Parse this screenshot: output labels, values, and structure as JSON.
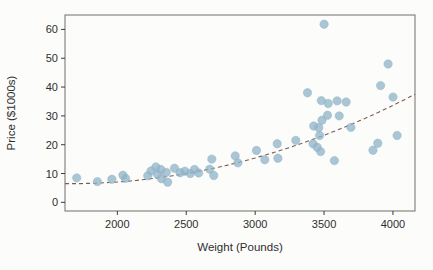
{
  "figure": {
    "background_color": "#fcfcfa",
    "box_color": "#6f6f6f",
    "tick_color": "#3a3a3a",
    "text_color": "#2e2e2e"
  },
  "chart_data": {
    "type": "scatter",
    "title": "",
    "xlabel": "Weight (Pounds)",
    "ylabel": "Price ($1000s)",
    "x_ticks": [
      2000,
      2500,
      3000,
      3500,
      4000
    ],
    "y_ticks": [
      0,
      10,
      20,
      30,
      40,
      50,
      60
    ],
    "xlim": [
      1620,
      4160
    ],
    "ylim": [
      -3,
      65
    ],
    "grid": false,
    "legend": null,
    "point_color": "#8FB3C7",
    "point_opacity": 0.75,
    "point_radius": 4.2,
    "points": [
      [
        1705,
        8.5
      ],
      [
        1855,
        7.2
      ],
      [
        1960,
        8.0
      ],
      [
        2040,
        9.4
      ],
      [
        2060,
        8.3
      ],
      [
        2220,
        9.2
      ],
      [
        2245,
        10.9
      ],
      [
        2280,
        12.3
      ],
      [
        2290,
        9.8
      ],
      [
        2315,
        11.4
      ],
      [
        2320,
        8.2
      ],
      [
        2355,
        10.4
      ],
      [
        2365,
        7.0
      ],
      [
        2415,
        11.8
      ],
      [
        2455,
        10.3
      ],
      [
        2490,
        10.8
      ],
      [
        2530,
        10.0
      ],
      [
        2560,
        11.4
      ],
      [
        2590,
        10.2
      ],
      [
        2670,
        11.5
      ],
      [
        2685,
        15.0
      ],
      [
        2700,
        9.3
      ],
      [
        2855,
        16.1
      ],
      [
        2875,
        13.7
      ],
      [
        3010,
        18.0
      ],
      [
        3070,
        14.8
      ],
      [
        3160,
        20.3
      ],
      [
        3165,
        15.3
      ],
      [
        3295,
        21.5
      ],
      [
        3380,
        38.0
      ],
      [
        3420,
        20.3
      ],
      [
        3425,
        26.5
      ],
      [
        3450,
        19.1
      ],
      [
        3462,
        25.9
      ],
      [
        3468,
        23.2
      ],
      [
        3475,
        17.6
      ],
      [
        3480,
        35.3
      ],
      [
        3485,
        28.5
      ],
      [
        3500,
        61.8
      ],
      [
        3525,
        30.2
      ],
      [
        3530,
        34.3
      ],
      [
        3575,
        14.5
      ],
      [
        3595,
        35.2
      ],
      [
        3610,
        30.0
      ],
      [
        3660,
        34.8
      ],
      [
        3695,
        26.0
      ],
      [
        3855,
        18.1
      ],
      [
        3890,
        20.5
      ],
      [
        3910,
        40.5
      ],
      [
        3965,
        48.0
      ],
      [
        4000,
        36.5
      ],
      [
        4030,
        23.2
      ]
    ],
    "trend_line": {
      "style": "dashed",
      "color": "#7d5c52",
      "model": "quadratic",
      "note": "price = a + b*(weight/1000) + c*(weight/1000)^2",
      "coefficients": {
        "a": 20.16,
        "b": -16.47,
        "c": 4.961
      },
      "x_range": [
        1620,
        4160
      ]
    }
  }
}
